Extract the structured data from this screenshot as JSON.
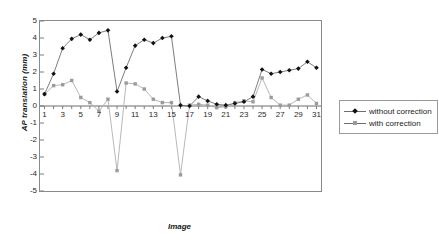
{
  "chart_data": {
    "type": "line",
    "title": "",
    "xlabel": "Image",
    "ylabel": "AP translation (mm)",
    "xlim": [
      0.5,
      31.5
    ],
    "ylim": [
      -5,
      5
    ],
    "ytick_step": 1,
    "yticks": [
      5,
      4,
      3,
      2,
      1,
      0,
      -1,
      -2,
      -3,
      -4,
      -5
    ],
    "ytick_labels": [
      "5",
      "4",
      "3",
      "2",
      "1",
      "0",
      "-1",
      "-2",
      "-3",
      "-4",
      "-5"
    ],
    "xticks": [
      1,
      3,
      5,
      7,
      9,
      11,
      13,
      15,
      17,
      19,
      21,
      23,
      25,
      27,
      29,
      31
    ],
    "xtick_labels": [
      "1",
      "3",
      "5",
      "7",
      "9",
      "11",
      "13",
      "15",
      "17",
      "19",
      "21",
      "23",
      "25",
      "27",
      "29",
      "31"
    ],
    "grid": false,
    "legend_position": "right",
    "x": [
      1,
      2,
      3,
      4,
      5,
      6,
      7,
      8,
      9,
      10,
      11,
      12,
      13,
      14,
      15,
      16,
      17,
      18,
      19,
      20,
      21,
      22,
      23,
      24,
      25,
      26,
      27,
      28,
      29,
      30,
      31
    ],
    "series": [
      {
        "name": "without correction",
        "marker": "diamond",
        "color": "#111111",
        "line_color": "#6e6e6e",
        "values": [
          0.7,
          1.9,
          3.4,
          3.95,
          4.2,
          3.9,
          4.3,
          4.45,
          0.85,
          2.25,
          3.55,
          3.9,
          3.7,
          4.0,
          4.1,
          0.05,
          0.0,
          0.55,
          0.3,
          0.1,
          0.05,
          0.15,
          0.25,
          0.55,
          2.15,
          1.9,
          2.0,
          2.1,
          2.2,
          2.6,
          2.25
        ]
      },
      {
        "name": "with correction",
        "marker": "square",
        "color": "#9b9b9b",
        "line_color": "#b0b0b0",
        "values": [
          0.7,
          1.2,
          1.25,
          1.5,
          0.5,
          0.2,
          -0.3,
          0.4,
          -3.8,
          1.35,
          1.3,
          1.0,
          0.4,
          0.2,
          0.2,
          -4.05,
          0.05,
          0.1,
          0.05,
          -0.1,
          -0.05,
          0.2,
          0.3,
          0.25,
          1.65,
          0.5,
          0.05,
          0.05,
          0.4,
          0.65,
          0.15
        ]
      }
    ]
  },
  "legend": {
    "items": [
      {
        "label": "without correction",
        "marker": "diamond"
      },
      {
        "label": "with correction",
        "marker": "square"
      }
    ]
  }
}
